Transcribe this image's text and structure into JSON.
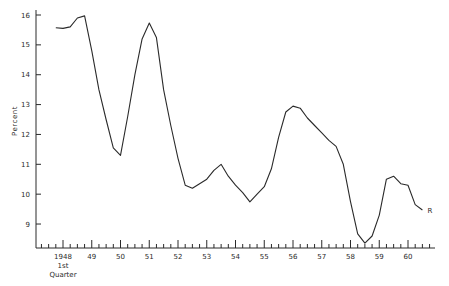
{
  "chart_data": {
    "type": "line",
    "title": "",
    "xlabel": "",
    "ylabel": "Percent",
    "ylim": [
      8.2,
      16
    ],
    "grid": false,
    "legend": null,
    "frequency": "quarterly",
    "x_tick_labels": [
      "1948",
      "49",
      "50",
      "51",
      "52",
      "53",
      "54",
      "55",
      "56",
      "57",
      "58",
      "59",
      "60"
    ],
    "x_tick_sublabel": [
      "1st",
      "Quarter"
    ],
    "y_ticks": [
      9,
      10,
      11,
      12,
      13,
      14,
      15,
      16
    ],
    "y_tick_labels": [
      "9",
      "10",
      "11",
      "12",
      "13",
      "14",
      "15",
      "16"
    ],
    "annotations": [
      {
        "text": "R",
        "position": "end of series"
      }
    ],
    "x": [
      "1947Q4",
      "1948Q1",
      "1948Q2",
      "1948Q3",
      "1948Q4",
      "1949Q1",
      "1949Q2",
      "1949Q3",
      "1949Q4",
      "1950Q1",
      "1950Q2",
      "1950Q3",
      "1950Q4",
      "1951Q1",
      "1951Q2",
      "1951Q3",
      "1951Q4",
      "1952Q1",
      "1952Q2",
      "1952Q3",
      "1952Q4",
      "1953Q1",
      "1953Q2",
      "1953Q3",
      "1953Q4",
      "1954Q1",
      "1954Q2",
      "1954Q3",
      "1954Q4",
      "1955Q1",
      "1955Q2",
      "1955Q3",
      "1955Q4",
      "1956Q1",
      "1956Q2",
      "1956Q3",
      "1956Q4",
      "1957Q1",
      "1957Q2",
      "1957Q3",
      "1957Q4",
      "1958Q1",
      "1958Q2",
      "1958Q3",
      "1958Q4",
      "1959Q1",
      "1959Q2",
      "1959Q3",
      "1959Q4",
      "1960Q1",
      "1960Q2",
      "1960Q3"
    ],
    "series": [
      {
        "name": "R",
        "values": [
          15.57,
          15.55,
          15.6,
          15.9,
          15.97,
          14.8,
          13.5,
          12.5,
          11.55,
          11.3,
          12.6,
          14.0,
          15.2,
          15.73,
          15.25,
          13.5,
          12.3,
          11.2,
          10.3,
          10.2,
          10.35,
          10.5,
          10.8,
          11.0,
          10.6,
          10.3,
          10.05,
          9.74,
          10.0,
          10.25,
          10.85,
          11.9,
          12.75,
          12.95,
          12.88,
          12.55,
          12.3,
          12.05,
          11.8,
          11.6,
          11.0,
          9.75,
          8.67,
          8.36,
          8.6,
          9.3,
          10.5,
          10.6,
          10.35,
          10.3,
          9.65,
          9.47
        ]
      }
    ]
  },
  "colors": {
    "line": "#2a2a2a",
    "axis": "#2a2a2a",
    "background": "#ffffff"
  }
}
